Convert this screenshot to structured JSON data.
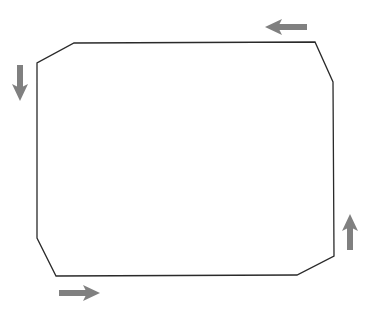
{
  "diagram": {
    "type": "closed-path-flow",
    "canvas": {
      "width": 371,
      "height": 314
    },
    "colors": {
      "background": "#ffffff",
      "outline": "#2a2a2a",
      "arrow": "#808080"
    },
    "outline": {
      "points": [
        [
          74,
          43
        ],
        [
          315,
          42
        ],
        [
          333,
          82
        ],
        [
          334,
          256
        ],
        [
          297,
          275
        ],
        [
          56,
          276
        ],
        [
          37,
          238
        ],
        [
          37,
          63
        ]
      ],
      "stroke_width": 1.3
    },
    "arrows": [
      {
        "name": "top-arrow",
        "direction": "left",
        "from": [
          307,
          27
        ],
        "to": [
          265,
          27
        ]
      },
      {
        "name": "left-arrow",
        "direction": "down",
        "from": [
          20,
          65
        ],
        "to": [
          20,
          101
        ]
      },
      {
        "name": "bottom-arrow",
        "direction": "right",
        "from": [
          59,
          293
        ],
        "to": [
          100,
          293
        ]
      },
      {
        "name": "right-arrow",
        "direction": "up",
        "from": [
          350,
          250
        ],
        "to": [
          350,
          214
        ]
      }
    ]
  }
}
